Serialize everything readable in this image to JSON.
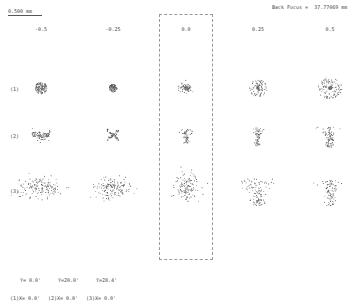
{
  "header": {
    "scale_label": "0.500 mm",
    "back_focus_label": "Back Focus =  37.77069 mm"
  },
  "columns": [
    {
      "label": "-0.5",
      "x": 41
    },
    {
      "label": "-0.25",
      "x": 113
    },
    {
      "label": "0.0",
      "x": 186
    },
    {
      "label": "0.25",
      "x": 258
    },
    {
      "label": "0.5",
      "x": 330
    }
  ],
  "rows": [
    {
      "label": "(1)",
      "y": 88
    },
    {
      "label": "(2)",
      "y": 135
    },
    {
      "label": "(3)",
      "y": 190
    }
  ],
  "legend": {
    "field1_y": "Y= 0.0'",
    "field1_x": "(1)X= 0.0'",
    "field2_y": "Y=20.0'",
    "field2_x": "(2)X= 0.0'",
    "field3_y": "Y=28.4'",
    "field3_x": "(3)X= 0.0'"
  },
  "highlight": {
    "column": "0.0",
    "style": "dashed-box"
  }
}
